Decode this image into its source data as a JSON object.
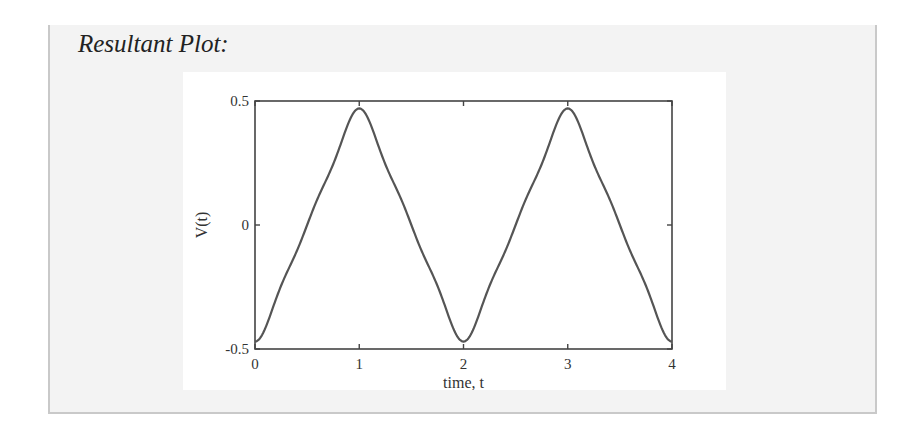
{
  "section": {
    "title": "Resultant Plot:"
  },
  "colors": {
    "panel_background": "#f3f3f3",
    "panel_border": "#c9c9c9",
    "figure_background": "#ffffff",
    "axis": "#444444",
    "line": "#555555",
    "text": "#333333"
  },
  "chart_data": {
    "type": "line",
    "title": "",
    "xlabel": "time, t",
    "ylabel": "V(t)",
    "xlim": [
      0,
      4
    ],
    "ylim": [
      -0.5,
      0.5
    ],
    "xticks": [
      0,
      1,
      2,
      3,
      4
    ],
    "xtick_labels": [
      "0",
      "1",
      "2",
      "3",
      "4"
    ],
    "yticks": [
      -0.5,
      0,
      0.5
    ],
    "ytick_labels": [
      "-0.5",
      "0",
      "0.5"
    ],
    "grid": false,
    "legend": null,
    "series": [
      {
        "name": "V(t)",
        "x": [
          0,
          0.5,
          1,
          1.5,
          2,
          2.5,
          3,
          3.5,
          4
        ],
        "values": [
          -0.47,
          0,
          0.47,
          0,
          -0.47,
          0,
          0.47,
          0,
          -0.47
        ]
      }
    ],
    "peaks": [
      {
        "t": 1,
        "v": 0.47
      },
      {
        "t": 3,
        "v": 0.47
      }
    ],
    "troughs": [
      {
        "t": 0,
        "v": -0.47
      },
      {
        "t": 2,
        "v": -0.47
      },
      {
        "t": 4,
        "v": -0.47
      }
    ]
  }
}
